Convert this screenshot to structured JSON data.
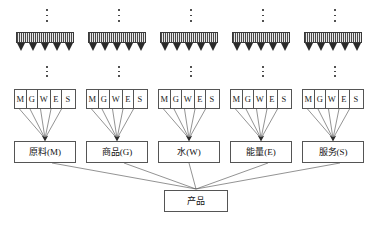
{
  "diagram": {
    "columns": [
      {
        "id": "col-m",
        "x": 14,
        "cells": [
          "M",
          "G",
          "W",
          "E",
          "S"
        ],
        "resource_label": "原料(M)",
        "arrow_count": 5
      },
      {
        "id": "col-g",
        "x": 86,
        "cells": [
          "M",
          "G",
          "W",
          "E",
          "S"
        ],
        "resource_label": "商品(G)",
        "arrow_count": 5
      },
      {
        "id": "col-w",
        "x": 158,
        "cells": [
          "M",
          "G",
          "W",
          "E",
          "S"
        ],
        "resource_label": "水(W)",
        "arrow_count": 5
      },
      {
        "id": "col-e",
        "x": 230,
        "cells": [
          "M",
          "G",
          "W",
          "E",
          "S"
        ],
        "resource_label": "能量(E)",
        "arrow_count": 5
      },
      {
        "id": "col-s",
        "x": 302,
        "cells": [
          "M",
          "G",
          "W",
          "E",
          "S"
        ],
        "resource_label": "服务(S)",
        "arrow_count": 5
      }
    ],
    "product": {
      "label": "产品"
    },
    "ellipsis": {
      "glyph": "⋮",
      "dot_count": 3
    },
    "colors": {
      "stroke": "#555555",
      "hatch_dark": "#4a4a4a",
      "hatch_light": "#e9e9e9",
      "arrow_fill": "#2b2b2b",
      "text": "#111111",
      "background": "#ffffff"
    }
  }
}
